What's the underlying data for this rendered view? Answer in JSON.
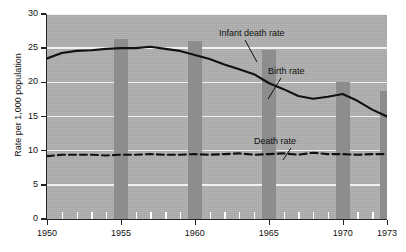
{
  "chart_data": {
    "type": "line",
    "title": "",
    "xlabel": "",
    "ylabel": "Rate per 1,000 population",
    "xlim": [
      1950,
      1973
    ],
    "ylim": [
      0,
      30
    ],
    "grid": true,
    "legend_position": "inline-annotations",
    "y_ticks": [
      0,
      5,
      10,
      15,
      20,
      25,
      30
    ],
    "y_tick_labels": [
      "0",
      "5",
      "10",
      "15",
      "20",
      "25",
      "30"
    ],
    "x_ticks": [
      1950,
      1955,
      1960,
      1965,
      1970,
      1973
    ],
    "x_tick_labels": [
      "1950",
      "1955",
      "1960",
      "1965",
      "1970",
      "1973"
    ],
    "x_minor_ticks": [
      1951,
      1952,
      1953,
      1954,
      1956,
      1957,
      1958,
      1959,
      1961,
      1962,
      1963,
      1964,
      1966,
      1967,
      1968,
      1969,
      1971,
      1972
    ],
    "annotations": [
      {
        "label": "Infant death rate",
        "target_series": "Infant death rate"
      },
      {
        "label": "Birth rate",
        "target_series": "Birth rate"
      },
      {
        "label": "Death rate",
        "target_series": "Death rate"
      }
    ],
    "series": [
      {
        "name": "Infant death rate",
        "type": "bar",
        "color": "#8d8d8d",
        "x": [
          1955,
          1960,
          1965,
          1970,
          1973
        ],
        "values": [
          26.4,
          26.0,
          24.7,
          20.0,
          18.8
        ]
      },
      {
        "name": "Birth rate",
        "type": "line",
        "style": "solid",
        "color": "#111111",
        "x": [
          1950,
          1951,
          1952,
          1953,
          1954,
          1955,
          1956,
          1957,
          1958,
          1959,
          1960,
          1961,
          1962,
          1963,
          1964,
          1965,
          1966,
          1967,
          1968,
          1969,
          1970,
          1971,
          1972,
          1973
        ],
        "values": [
          23.5,
          24.3,
          24.6,
          24.7,
          24.9,
          25.0,
          25.0,
          25.2,
          24.9,
          24.6,
          24.0,
          23.4,
          22.6,
          21.9,
          21.2,
          19.9,
          19.0,
          18.0,
          17.6,
          17.9,
          18.3,
          17.3,
          16.0,
          15.0
        ]
      },
      {
        "name": "Death rate",
        "type": "line",
        "style": "dashed",
        "color": "#111111",
        "x": [
          1950,
          1951,
          1952,
          1953,
          1954,
          1955,
          1956,
          1957,
          1958,
          1959,
          1960,
          1961,
          1962,
          1963,
          1964,
          1965,
          1966,
          1967,
          1968,
          1969,
          1970,
          1971,
          1972,
          1973
        ],
        "values": [
          9.2,
          9.4,
          9.4,
          9.4,
          9.3,
          9.4,
          9.4,
          9.5,
          9.4,
          9.4,
          9.5,
          9.4,
          9.5,
          9.6,
          9.4,
          9.5,
          9.6,
          9.4,
          9.7,
          9.5,
          9.5,
          9.4,
          9.5,
          9.5
        ]
      }
    ]
  },
  "axis": {
    "y_title": "Rate per 1,000 population"
  },
  "colors": {
    "plot_background": "#b0b0b0",
    "bar": "#8d8d8d",
    "gridline": "#f2f2f2",
    "line": "#111111",
    "page_background": "#ffffff"
  }
}
